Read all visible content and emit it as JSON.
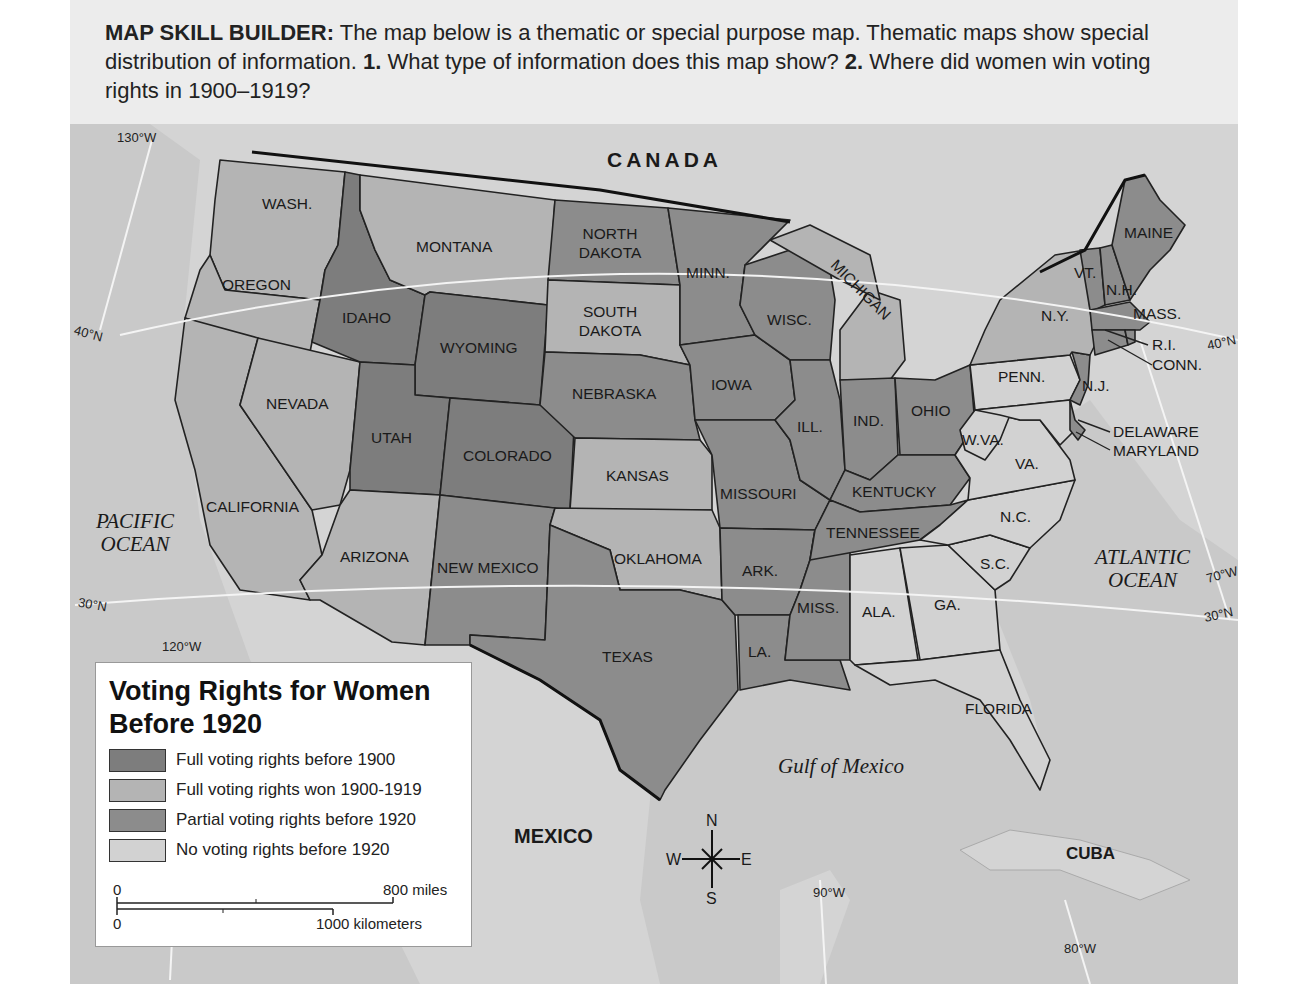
{
  "header": {
    "label": "MAP SKILL BUILDER:",
    "text1": " The map below is a thematic or special purpose map. Thematic maps show special distribution of information.   ",
    "q1_num": "1.",
    "q1": " What type of information does this map show?   ",
    "q2_num": "2.",
    "q2": " Where did women win voting rights in 1900–1919?"
  },
  "legend": {
    "title": "Voting Rights for Women Before 1920",
    "items": [
      {
        "label": "Full voting rights before 1900",
        "color": "#7d7d7d"
      },
      {
        "label": "Full voting rights won 1900-1919",
        "color": "#b4b4b4"
      },
      {
        "label": "Partial voting rights before 1920",
        "color": "#8c8c8c"
      },
      {
        "label": "No voting rights before 1920",
        "color": "#d2d2d2"
      }
    ],
    "scale": {
      "miles_zero": "0",
      "miles": "800 miles",
      "km_zero": "0",
      "km": "1000 kilometers"
    }
  },
  "colors": {
    "water": "#c9c9c9",
    "full_before_1900": "#7d7d7d",
    "full_1900_1919": "#b4b4b4",
    "partial": "#8c8c8c",
    "none": "#d2d2d2"
  },
  "labels": {
    "countries": {
      "canada": "CANADA",
      "mexico": "MEXICO",
      "cuba": "CUBA"
    },
    "water": {
      "pacific": "PACIFIC OCEAN",
      "atlantic": "ATLANTIC OCEAN",
      "gulf": "Gulf of Mexico"
    },
    "coords": {
      "w130": "130°W",
      "w120": "120°W",
      "w90": "90°W",
      "w80": "80°W",
      "w70": "70°W",
      "n40_left": "40°N",
      "n40_right": "40°N",
      "n30_left": "30°N",
      "n30_right": "30°N"
    },
    "compass": {
      "n": "N",
      "s": "S",
      "e": "E",
      "w": "W"
    }
  },
  "states": [
    {
      "name": "WASH.",
      "status": "full_1900_1919"
    },
    {
      "name": "OREGON",
      "status": "full_1900_1919"
    },
    {
      "name": "CALIFORNIA",
      "status": "full_1900_1919"
    },
    {
      "name": "IDAHO",
      "status": "full_before_1900"
    },
    {
      "name": "NEVADA",
      "status": "full_1900_1919"
    },
    {
      "name": "MONTANA",
      "status": "full_1900_1919"
    },
    {
      "name": "WYOMING",
      "status": "full_before_1900"
    },
    {
      "name": "UTAH",
      "status": "full_before_1900"
    },
    {
      "name": "COLORADO",
      "status": "full_before_1900"
    },
    {
      "name": "ARIZONA",
      "status": "full_1900_1919"
    },
    {
      "name": "NEW MEXICO",
      "status": "partial"
    },
    {
      "name": "NORTH DAKOTA",
      "status": "partial"
    },
    {
      "name": "SOUTH DAKOTA",
      "status": "full_1900_1919"
    },
    {
      "name": "NEBRASKA",
      "status": "partial"
    },
    {
      "name": "KANSAS",
      "status": "full_1900_1919"
    },
    {
      "name": "OKLAHOMA",
      "status": "full_1900_1919"
    },
    {
      "name": "TEXAS",
      "status": "partial"
    },
    {
      "name": "MINN.",
      "status": "partial"
    },
    {
      "name": "IOWA",
      "status": "partial"
    },
    {
      "name": "MISSOURI",
      "status": "partial"
    },
    {
      "name": "ARK.",
      "status": "partial"
    },
    {
      "name": "LA.",
      "status": "partial"
    },
    {
      "name": "WISC.",
      "status": "partial"
    },
    {
      "name": "ILL.",
      "status": "partial"
    },
    {
      "name": "MISS.",
      "status": "partial"
    },
    {
      "name": "MICHIGAN",
      "status": "full_1900_1919"
    },
    {
      "name": "IND.",
      "status": "partial"
    },
    {
      "name": "OHIO",
      "status": "partial"
    },
    {
      "name": "KENTUCKY",
      "status": "partial"
    },
    {
      "name": "TENNESSEE",
      "status": "partial"
    },
    {
      "name": "ALA.",
      "status": "none"
    },
    {
      "name": "GA.",
      "status": "none"
    },
    {
      "name": "FLORIDA",
      "status": "none"
    },
    {
      "name": "S.C.",
      "status": "none"
    },
    {
      "name": "N.C.",
      "status": "none"
    },
    {
      "name": "VA.",
      "status": "none"
    },
    {
      "name": "W.VA.",
      "status": "none"
    },
    {
      "name": "PENN.",
      "status": "none"
    },
    {
      "name": "N.Y.",
      "status": "full_1900_1919"
    },
    {
      "name": "N.J.",
      "status": "partial"
    },
    {
      "name": "DELAWARE",
      "status": "partial"
    },
    {
      "name": "MARYLAND",
      "status": "none"
    },
    {
      "name": "VT.",
      "status": "partial"
    },
    {
      "name": "N.H.",
      "status": "partial"
    },
    {
      "name": "MAINE",
      "status": "partial"
    },
    {
      "name": "MASS.",
      "status": "partial"
    },
    {
      "name": "R.I.",
      "status": "partial"
    },
    {
      "name": "CONN.",
      "status": "partial"
    }
  ]
}
